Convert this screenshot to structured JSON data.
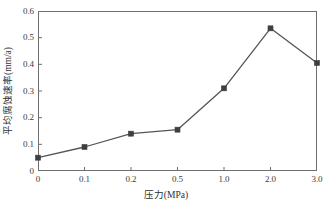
{
  "chart_data": {
    "type": "line",
    "title": "",
    "subtitle": "",
    "xlabel": "压力(MPa)",
    "ylabel": "平均腐蚀速率(mm/a)",
    "categories": [
      "0",
      "0.1",
      "0.2",
      "0.5",
      "1.0",
      "2.0",
      "3.0"
    ],
    "values": [
      0.05,
      0.09,
      0.14,
      0.155,
      0.31,
      0.535,
      0.405
    ],
    "series": [
      {
        "name": "平均腐蚀速率",
        "values": [
          0.05,
          0.09,
          0.14,
          0.155,
          0.31,
          0.535,
          0.405
        ]
      }
    ],
    "ylim": [
      0,
      0.6
    ],
    "yticks": [
      "0",
      "0.1",
      "0.2",
      "0.3",
      "0.4",
      "0.5",
      "0.6"
    ],
    "ytick_values": [
      0,
      0.1,
      0.2,
      0.3,
      0.4,
      0.5,
      0.6
    ],
    "xticks": [
      "0",
      "0.1",
      "0.2",
      "0.5",
      "1.0",
      "2.0",
      "3.0"
    ],
    "grid": false,
    "legend": "none",
    "marker": "square",
    "line_color": "#555555",
    "marker_color": "#3f3f3f",
    "axis_color": "#6f6f6f",
    "background_color": "#ffffff"
  }
}
